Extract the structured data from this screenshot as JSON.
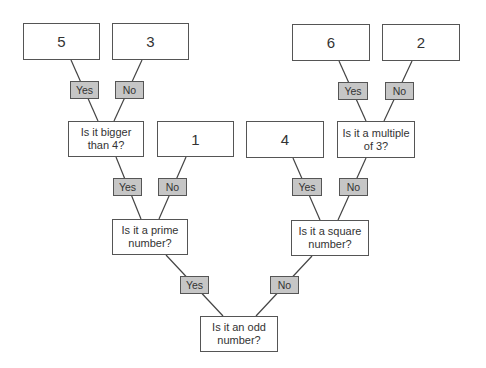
{
  "diagram": {
    "type": "decision-tree",
    "root": {
      "question": "Is it an odd number?",
      "yes": {
        "label": "Yes",
        "question": "Is it a prime number?",
        "yes": {
          "label": "Yes",
          "question": "Is it bigger than 4?",
          "yes": {
            "label": "Yes",
            "value": "5"
          },
          "no": {
            "label": "No",
            "value": "3"
          }
        },
        "no": {
          "label": "No",
          "value": "1"
        }
      },
      "no": {
        "label": "No",
        "question": "Is it a square number?",
        "yes": {
          "label": "Yes",
          "value": "4"
        },
        "no": {
          "label": "No",
          "question": "Is it a multiple of 3?",
          "yes": {
            "label": "Yes",
            "value": "6"
          },
          "no": {
            "label": "No",
            "value": "2"
          }
        }
      }
    }
  },
  "colors": {
    "border": "#555555",
    "tag_fill": "#c6c6c6",
    "text": "#333333"
  }
}
